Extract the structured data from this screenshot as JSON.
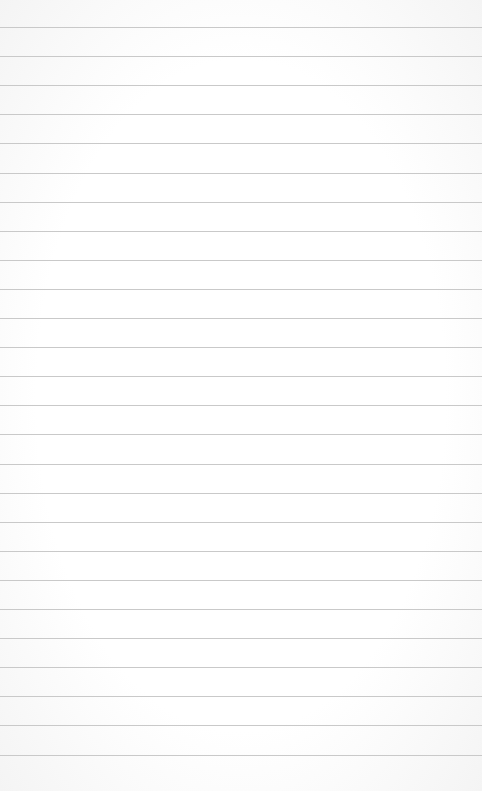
{
  "paper": {
    "type": "lined-paper",
    "background_color": "#fdfdfd",
    "line_color": "#c9c9c9",
    "first_line_y": 27,
    "line_spacing": 29.1,
    "line_count": 26
  }
}
